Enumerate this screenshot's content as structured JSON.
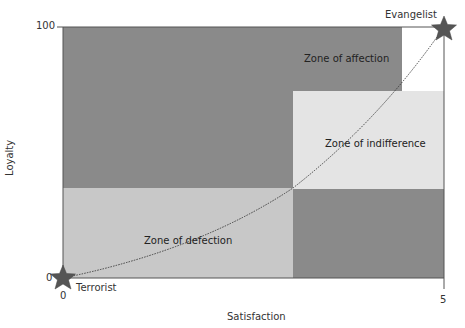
{
  "diagram": {
    "type": "loyalty-satisfaction-zones",
    "x_axis": {
      "label": "Satisfaction",
      "min_tick": "0",
      "max_tick": "5"
    },
    "y_axis": {
      "label": "Loyalty",
      "min_tick": "0",
      "max_tick": "100"
    },
    "zones": [
      {
        "label": "Zone of affection",
        "shade": "#8a8a8a"
      },
      {
        "label": "Zone of indifference",
        "shade": "#e4e4e4"
      },
      {
        "label": "Zone of defection",
        "shade": "#c8c8c8"
      }
    ],
    "endpoints": [
      {
        "label": "Terrorist",
        "icon": "star-icon"
      },
      {
        "label": "Evangelist",
        "icon": "star-icon"
      }
    ],
    "colors": {
      "dark_zone": "#8a8a8a",
      "light_zone": "#e4e4e4",
      "mid_zone": "#c8c8c8",
      "star": "#555555",
      "axis": "#555555"
    }
  }
}
